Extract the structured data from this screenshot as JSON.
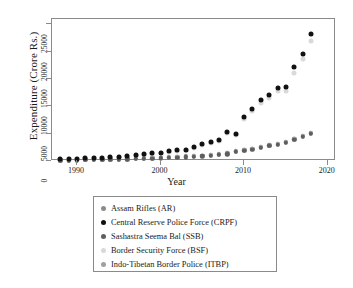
{
  "chart_data": {
    "type": "scatter",
    "title": "",
    "xlabel": "Year",
    "ylabel": "Expenditure (Crore Rs.)",
    "xlim": [
      1987,
      2021
    ],
    "ylim": [
      0,
      26000
    ],
    "xticks": [
      1990,
      2000,
      2010,
      2020
    ],
    "yticks": [
      0,
      5000,
      10000,
      15000,
      20000,
      25000
    ],
    "ytick_labels": [
      "0",
      "5000",
      "10000",
      "15000",
      "20000",
      "25000"
    ],
    "xtick_labels": [
      "1990",
      "2000",
      "2010",
      "2020"
    ],
    "grid": false,
    "legend_position": "below-center",
    "x": [
      1988,
      1989,
      1990,
      1991,
      1992,
      1993,
      1994,
      1995,
      1996,
      1997,
      1998,
      1999,
      2000,
      2001,
      2002,
      2003,
      2004,
      2005,
      2006,
      2007,
      2008,
      2009,
      2010,
      2011,
      2012,
      2013,
      2014,
      2015,
      2016,
      2017,
      2018
    ],
    "series": [
      {
        "name": "Assam Rifles (AR)",
        "key": "ar",
        "color": "#8c8c8c",
        "values": [
          130,
          150,
          170,
          200,
          230,
          260,
          300,
          340,
          380,
          430,
          480,
          560,
          640,
          700,
          760,
          830,
          900,
          1000,
          1100,
          1250,
          1400,
          1800,
          2050,
          2250,
          2600,
          2900,
          3150,
          3500,
          4100,
          4600,
          5200
        ]
      },
      {
        "name": "Central Reserve Police Force (CRPF)",
        "key": "crpf",
        "color": "#111111",
        "values": [
          330,
          380,
          430,
          500,
          560,
          620,
          700,
          800,
          900,
          1050,
          1250,
          1450,
          1500,
          1750,
          1950,
          2050,
          2500,
          3100,
          3400,
          3800,
          5400,
          5000,
          8000,
          9600,
          11100,
          12000,
          13400,
          13500,
          17200,
          19600,
          23200
        ]
      },
      {
        "name": "Sashastra Seema Bal (SSB)",
        "key": "ssb",
        "color": "#5e5e5e",
        "values": [
          110,
          130,
          150,
          170,
          190,
          220,
          250,
          280,
          310,
          350,
          400,
          450,
          500,
          560,
          620,
          700,
          780,
          880,
          980,
          1100,
          1250,
          1650,
          1900,
          2100,
          2450,
          2750,
          3000,
          3350,
          3900,
          4400,
          5000
        ]
      },
      {
        "name": "Border Security Force (BSF)",
        "key": "bsf",
        "color": "#d9d9d9",
        "values": [
          300,
          350,
          400,
          460,
          520,
          580,
          660,
          750,
          850,
          1000,
          1150,
          1350,
          1400,
          1650,
          1850,
          1950,
          2350,
          2950,
          3250,
          3650,
          5100,
          4700,
          7600,
          9200,
          10600,
          11500,
          12800,
          12900,
          16200,
          18600,
          22000
        ]
      },
      {
        "name": "Indo-Tibetan Border Police (ITBP)",
        "key": "itbp",
        "color": "#a0a0a0",
        "values": [
          120,
          140,
          160,
          185,
          210,
          240,
          275,
          310,
          345,
          390,
          440,
          500,
          580,
          640,
          700,
          770,
          840,
          940,
          1040,
          1180,
          1320,
          1720,
          1980,
          2180,
          2520,
          2830,
          3080,
          3420,
          4000,
          4500,
          5100
        ]
      }
    ]
  },
  "legend": {
    "items": [
      {
        "label": "Assam Rifles (AR)"
      },
      {
        "label": "Central Reserve Police Force (CRPF)"
      },
      {
        "label": "Sashastra Seema Bal (SSB)"
      },
      {
        "label": "Border Security Force (BSF)"
      },
      {
        "label": "Indo-Tibetan Border Police (ITBP)"
      }
    ]
  }
}
